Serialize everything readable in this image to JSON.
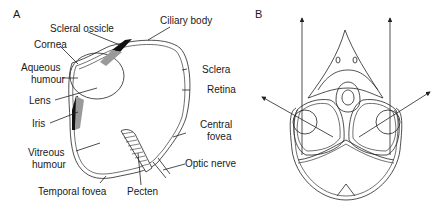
{
  "panels": {
    "a": {
      "letter": "A",
      "labels": {
        "scleral_ossicle": "Scleral ossicle",
        "ciliary_body": "Ciliary body",
        "cornea": "Cornea",
        "aqueous_humour_1": "Aqueous",
        "aqueous_humour_2": "humour",
        "sclera": "Sclera",
        "retina": "Retina",
        "lens": "Lens",
        "iris": "Iris",
        "central_fovea_1": "Central",
        "central_fovea_2": "fovea",
        "vitreous_humour_1": "Vitreous",
        "vitreous_humour_2": "humour",
        "optic_nerve": "Optic nerve",
        "temporal_fovea": "Temporal fovea",
        "pecten": "Pecten"
      }
    },
    "b": {
      "letter": "B"
    }
  }
}
